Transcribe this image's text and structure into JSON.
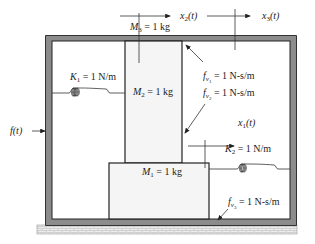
{
  "diagram": {
    "type": "mechanical-translational-system",
    "labels": {
      "M1": "M",
      "M1_sub": "1",
      "M1_val": " = 1 kg",
      "M2": "M",
      "M2_sub": "2",
      "M2_val": " = 1 kg",
      "M3": "M",
      "M3_sub": "3",
      "M3_val": " = 1 kg",
      "K1": "K",
      "K1_sub": "1",
      "K1_val": " = 1 N/m",
      "K2": "K",
      "K2_sub": "2",
      "K2_val": " = 1 N/m",
      "fv1": "f",
      "fv1_sub": "v",
      "fv1_subsub": "1",
      "fv1_val": " = 1 N-s/m",
      "fv2": "f",
      "fv2_sub": "v",
      "fv2_subsub": "2",
      "fv2_val": " = 1 N-s/m",
      "fv3": "f",
      "fv3_sub": "v",
      "fv3_subsub": "3",
      "fv3_val": " = 1 N-s/m",
      "x1": "x",
      "x1_sub": "1",
      "x1_arg": "(t)",
      "x2": "x",
      "x2_sub": "2",
      "x2_arg": "(t)",
      "x3": "x",
      "x3_sub": "3",
      "x3_arg": "(t)",
      "force": "f(t)"
    },
    "colors": {
      "frame": "#8c8c8c",
      "frame_border": "#333333",
      "mass_fill": "#f5f5f5",
      "ground_fill": "#ececec",
      "line": "#333333"
    }
  }
}
